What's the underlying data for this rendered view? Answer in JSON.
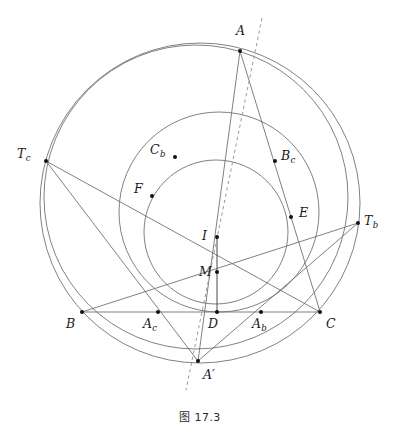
{
  "figure": {
    "caption": "图 17.3",
    "caption_number": "17.3",
    "title": "图 17.3",
    "background_color": "#ffffff",
    "stroke_color": "#6a6a6a",
    "point_color": "#111111",
    "dash_color": "#8d8d8d",
    "width": 400,
    "height": 444
  },
  "points": [
    {
      "id": "A",
      "label": "A",
      "sub": "",
      "prime": false,
      "x": 240,
      "y": 51,
      "label_x": 236,
      "label_y": 25
    },
    {
      "id": "B",
      "label": "B",
      "sub": "",
      "prime": false,
      "x": 82,
      "y": 312,
      "label_x": 66,
      "label_y": 318
    },
    {
      "id": "C",
      "label": "C",
      "sub": "",
      "prime": false,
      "x": 320,
      "y": 312,
      "label_x": 326,
      "label_y": 318
    },
    {
      "id": "Ac",
      "label": "A",
      "sub": "c",
      "prime": false,
      "x": 158,
      "y": 312,
      "label_x": 143,
      "label_y": 318
    },
    {
      "id": "Ab",
      "label": "A",
      "sub": "b",
      "prime": false,
      "x": 261,
      "y": 312,
      "label_x": 252,
      "label_y": 318
    },
    {
      "id": "D",
      "label": "D",
      "sub": "",
      "prime": false,
      "x": 217,
      "y": 312,
      "label_x": 208,
      "label_y": 318
    },
    {
      "id": "Aprime",
      "label": "A",
      "sub": "",
      "prime": true,
      "x": 198,
      "y": 361,
      "label_x": 203,
      "label_y": 369
    },
    {
      "id": "Tc",
      "label": "T",
      "sub": "c",
      "prime": false,
      "x": 46,
      "y": 161,
      "label_x": 17,
      "label_y": 148
    },
    {
      "id": "Tb",
      "label": "T",
      "sub": "b",
      "prime": false,
      "x": 358,
      "y": 223,
      "label_x": 364,
      "label_y": 215
    },
    {
      "id": "Cb",
      "label": "C",
      "sub": "b",
      "prime": false,
      "x": 175,
      "y": 157,
      "label_x": 150,
      "label_y": 144
    },
    {
      "id": "Bc",
      "label": "B",
      "sub": "c",
      "prime": false,
      "x": 275,
      "y": 161,
      "label_x": 281,
      "label_y": 150
    },
    {
      "id": "F",
      "label": "F",
      "sub": "",
      "prime": false,
      "x": 152,
      "y": 196,
      "label_x": 134,
      "label_y": 183
    },
    {
      "id": "E",
      "label": "E",
      "sub": "",
      "prime": false,
      "x": 291,
      "y": 217,
      "label_x": 299,
      "label_y": 207
    },
    {
      "id": "I",
      "label": "I",
      "sub": "",
      "prime": false,
      "x": 217,
      "y": 237,
      "label_x": 202,
      "label_y": 230
    },
    {
      "id": "M",
      "label": "M",
      "sub": "",
      "prime": false,
      "x": 217,
      "y": 272,
      "label_x": 199,
      "label_y": 266
    }
  ],
  "circles": [
    {
      "id": "circumcircle",
      "name": "circumcircle-ABC",
      "cx": 200,
      "cy": 203,
      "r": 160
    },
    {
      "id": "second-circle",
      "name": "second-large-circle",
      "cx": 196,
      "cy": 197,
      "r": 152
    },
    {
      "id": "mixtilinear",
      "name": "medium-circle",
      "cx": 219,
      "cy": 212,
      "r": 100
    },
    {
      "id": "incircle",
      "name": "incircle",
      "cx": 216,
      "cy": 232,
      "r": 72
    }
  ],
  "segments": [
    {
      "id": "seg-BC",
      "name": "side-BC",
      "from": "B",
      "to": "C"
    },
    {
      "id": "seg-AB",
      "name": "side-AB",
      "from": "A",
      "to": "Aprime-through-F"
    },
    {
      "id": "seg-AC",
      "name": "side-AC",
      "from": "A",
      "to": "C"
    },
    {
      "id": "seg-TcC",
      "name": "chord-Tc-C",
      "from": "Tc",
      "to": "C"
    },
    {
      "id": "seg-TbB",
      "name": "chord-Tb-B",
      "from": "Tb",
      "to": "B"
    },
    {
      "id": "seg-TcAp",
      "name": "chord-Tc-Ap",
      "from": "Tc",
      "to": "Aprime"
    },
    {
      "id": "seg-TbAp",
      "name": "chord-Tb-Ap",
      "from": "Tb",
      "to": "Aprime"
    },
    {
      "id": "seg-ID",
      "name": "incenter-to-D",
      "from": "I",
      "to": "D"
    }
  ],
  "dashed_line": {
    "id": "dashed-axis",
    "name": "dashed-line-A-to-Aprime-extended",
    "x1": 262,
    "y1": 18,
    "x2": 186,
    "y2": 390
  },
  "labels": {
    "A": "A",
    "B": "B",
    "C": "C",
    "D": "D",
    "E": "E",
    "F": "F",
    "I": "I",
    "M": "M",
    "A_prime": "A′",
    "A_c": "Ac",
    "A_b": "Ab",
    "T_c": "Tc",
    "T_b": "Tb",
    "C_b": "Cb",
    "B_c": "Bc"
  }
}
